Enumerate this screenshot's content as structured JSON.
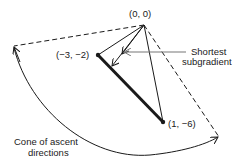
{
  "diagram": {
    "points": [
      {
        "id": "origin",
        "label": "(0, 0)"
      },
      {
        "id": "g1",
        "label": "(−3, −2)"
      },
      {
        "id": "g2",
        "label": "(1, −6)"
      }
    ],
    "annotations": {
      "shortest_subgradient_line1": "Shortest",
      "shortest_subgradient_line2": "subgradient",
      "cone_line1": "Cone of ascent",
      "cone_line2": "directions"
    },
    "colors": {
      "ink": "#1a1a1a",
      "pointer": "#777777"
    }
  }
}
